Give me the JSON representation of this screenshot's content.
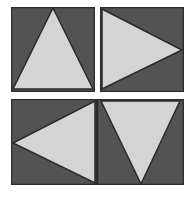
{
  "figure": {
    "background_color": "#ffffff",
    "panel_count": 4,
    "colors": {
      "panel_fill": "#535353",
      "triangle_fill": "#d4d4d4",
      "outline": "#2b2b2b",
      "background": "#ffffff"
    },
    "panels": [
      {
        "id": "top-left",
        "position": "top-left",
        "label": "",
        "panel_fill": "#535353",
        "triangle_fill": "#d4d4d4",
        "outline": "#2b2b2b",
        "triangle_direction": "up",
        "triangle_points": "42,1 82,82 2,82",
        "viewbox": "0 0 84 85"
      },
      {
        "id": "top-right",
        "position": "top-right",
        "label": "",
        "panel_fill": "#535353",
        "triangle_fill": "#d4d4d4",
        "outline": "#2b2b2b",
        "triangle_direction": "right",
        "triangle_points": "2,2 82,43 2,82",
        "viewbox": "0 0 84 85"
      },
      {
        "id": "bottom-left",
        "position": "bottom-left",
        "label": "",
        "panel_fill": "#535353",
        "triangle_fill": "#d4d4d4",
        "outline": "#2b2b2b",
        "triangle_direction": "left",
        "triangle_points": "2,44 84,2 84,84",
        "viewbox": "0 0 86 86"
      },
      {
        "id": "bottom-right",
        "position": "bottom-right",
        "label": "",
        "panel_fill": "#535353",
        "triangle_fill": "#d4d4d4",
        "outline": "#2b2b2b",
        "triangle_direction": "down",
        "triangle_points": "4,2 83,2 44,85",
        "viewbox": "0 0 87 86"
      }
    ]
  }
}
